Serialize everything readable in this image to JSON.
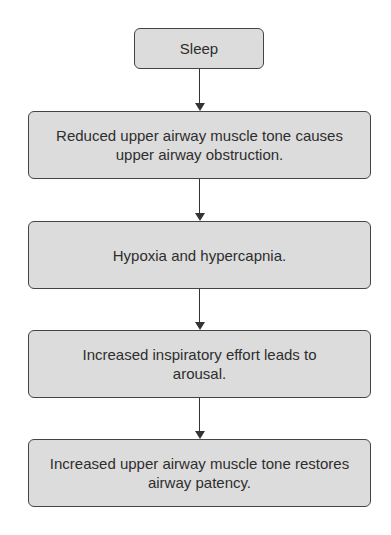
{
  "diagram": {
    "type": "flowchart",
    "direction": "top-to-bottom",
    "nodes": [
      {
        "id": "sleep",
        "label": "Sleep"
      },
      {
        "id": "reduced-tone",
        "label": "Reduced upper airway muscle tone causes upper airway obstruction."
      },
      {
        "id": "hypoxia",
        "label": "Hypoxia and hypercapnia."
      },
      {
        "id": "effort",
        "label": "Increased inspiratory effort leads to arousal."
      },
      {
        "id": "increased-tone",
        "label": "Increased upper airway muscle tone restores airway patency."
      }
    ],
    "edges": [
      {
        "from": "sleep",
        "to": "reduced-tone"
      },
      {
        "from": "reduced-tone",
        "to": "hypoxia"
      },
      {
        "from": "hypoxia",
        "to": "effort"
      },
      {
        "from": "effort",
        "to": "increased-tone"
      }
    ],
    "colors": {
      "box_fill": "#dcdcdc",
      "border": "#444444",
      "text": "#2e2e2e",
      "arrow": "#333333"
    }
  }
}
